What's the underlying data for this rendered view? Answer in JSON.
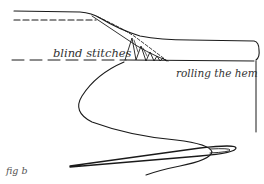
{
  "figure": {
    "caption": "fig b",
    "labels": {
      "blind_stitches": "blind stitches",
      "rolling_the_hem": "rolling the hem"
    },
    "elements": [
      "fabric-top-edge",
      "fold-line-dashed",
      "hemline-dashed",
      "rolled-hem",
      "blind-stitches",
      "thread",
      "needle"
    ],
    "colors": {
      "ink": "#1a1a1a",
      "text": "#333333",
      "background": "#ffffff"
    }
  }
}
